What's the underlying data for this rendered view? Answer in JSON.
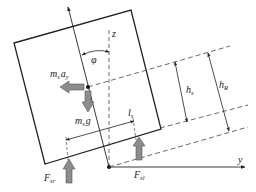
{
  "diagram": {
    "type": "free-body diagram of tilted vehicle body",
    "colors": {
      "line": "#222222",
      "dash": "#444444",
      "force_arrow_fill": "#8c8c8c",
      "force_arrow_stroke": "#555555"
    },
    "labels": {
      "lateral_force": {
        "main": "m",
        "sub1": "s",
        "main2": "a",
        "sub2": "y"
      },
      "gravity_force": {
        "main": "m",
        "sub1": "s",
        "main2": "g"
      },
      "angle": "φ",
      "z_axis": "z",
      "y_axis": "y",
      "h_s": {
        "main": "h",
        "sub": "s"
      },
      "h_R": {
        "main": "h",
        "sub": "R"
      },
      "l_s": {
        "main": "l",
        "sub": "s"
      },
      "F_sr": {
        "main": "F",
        "sub": "sr"
      },
      "F_sl": {
        "main": "F",
        "sub": "sl"
      }
    }
  }
}
